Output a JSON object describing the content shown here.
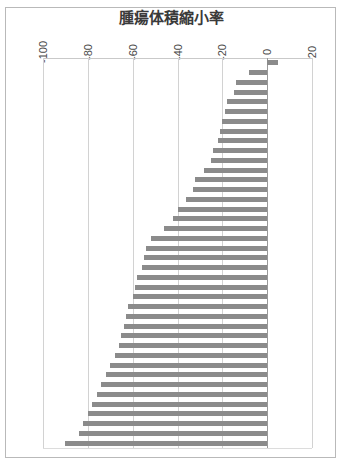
{
  "chart_data": {
    "type": "bar",
    "orientation": "horizontal",
    "subtype": "waterfall",
    "title": "腫瘍体積縮小率",
    "xlabel": "",
    "ylabel": "",
    "xlim": [
      -100,
      20
    ],
    "xticks": [
      -100,
      -80,
      -60,
      -40,
      -20,
      0,
      20
    ],
    "xtick_labels": [
      "-100",
      "-80",
      "-60",
      "-40",
      "-20",
      "0",
      "20"
    ],
    "grid": true,
    "legend": "none",
    "bar_color": "#8b8b8b",
    "zero_line": 0,
    "categories": [
      "1",
      "2",
      "3",
      "4",
      "5",
      "6",
      "7",
      "8",
      "9",
      "10",
      "11",
      "12",
      "13",
      "14",
      "15",
      "16",
      "17",
      "18",
      "19",
      "20",
      "21",
      "22",
      "23",
      "24",
      "25",
      "26",
      "27",
      "28",
      "29",
      "30",
      "31",
      "32",
      "33",
      "34",
      "35",
      "36",
      "37",
      "38",
      "39",
      "40"
    ],
    "values": [
      5,
      -8,
      -14,
      -15,
      -18,
      -19,
      -20,
      -21,
      -22,
      -24,
      -25,
      -28,
      -32,
      -33,
      -36,
      -40,
      -42,
      -46,
      -52,
      -54,
      -55,
      -56,
      -58,
      -59,
      -60,
      -62,
      -63,
      -64,
      -65,
      -66,
      -68,
      -70,
      -72,
      -74,
      -76,
      -78,
      -80,
      -82,
      -84,
      -90
    ]
  },
  "axis": {
    "tick_labels": [
      "-100",
      "-80",
      "-60",
      "-40",
      "-20",
      "0",
      "20"
    ]
  },
  "title": {
    "text": "腫瘍体積縮小率"
  }
}
